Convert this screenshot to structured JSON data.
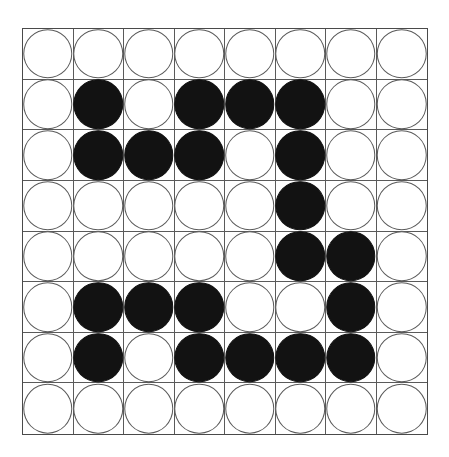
{
  "board": {
    "title": "8x8 circle grid puzzle",
    "rows": 8,
    "columns": 8,
    "colors": {
      "filled": "#121212",
      "empty": "#ffffff",
      "grid_line": "#5a5a5a",
      "outline": "#4a4a4a",
      "background": "#ffffff"
    },
    "legend": {
      "filled_label": "black",
      "empty_label": "white"
    },
    "counts": {
      "filled": 25,
      "empty": 39,
      "total": 64
    },
    "cells": [
      [
        "white",
        "white",
        "white",
        "white",
        "white",
        "white",
        "white",
        "white"
      ],
      [
        "white",
        "black",
        "white",
        "black",
        "black",
        "black",
        "white",
        "white"
      ],
      [
        "white",
        "black",
        "black",
        "black",
        "white",
        "black",
        "white",
        "white"
      ],
      [
        "white",
        "white",
        "white",
        "white",
        "white",
        "black",
        "white",
        "white"
      ],
      [
        "white",
        "white",
        "white",
        "white",
        "white",
        "black",
        "black",
        "white"
      ],
      [
        "white",
        "black",
        "black",
        "black",
        "white",
        "white",
        "black",
        "white"
      ],
      [
        "white",
        "black",
        "white",
        "black",
        "black",
        "black",
        "black",
        "white"
      ],
      [
        "white",
        "white",
        "white",
        "white",
        "white",
        "white",
        "white",
        "white"
      ]
    ]
  }
}
